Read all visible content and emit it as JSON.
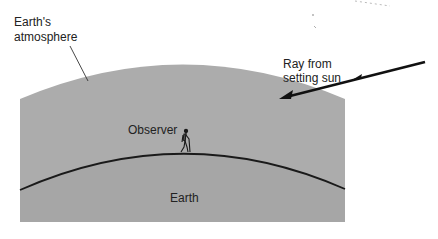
{
  "diagram": {
    "labels": {
      "atmosphere_line1": "Earth's",
      "atmosphere_line2": "atmosphere",
      "ray_line1": "Ray from",
      "ray_line2": "setting sun",
      "observer": "Observer",
      "earth": "Earth"
    },
    "colors": {
      "atmosphere": "#acacac",
      "earth": "#a6a6a6",
      "line": "#1a1a1a",
      "text": "#222222"
    },
    "icons": {
      "observer": "hiker-figure",
      "ray": "arrow-left-down"
    }
  }
}
